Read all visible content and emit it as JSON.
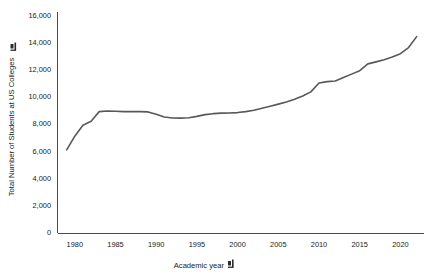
{
  "chart_data": {
    "type": "line",
    "title": "",
    "xlabel": "Academic year",
    "ylabel": "Total Number of Students at US Colleges",
    "xlim": [
      1978,
      2023
    ],
    "ylim": [
      0,
      16800
    ],
    "grid": false,
    "legend": null,
    "x_ticks": [
      "1980",
      "1985",
      "1990",
      "1995",
      "2000",
      "2005",
      "2010",
      "2015",
      "2020"
    ],
    "x_tick_values": [
      1980,
      1985,
      1990,
      1995,
      2000,
      2005,
      2010,
      2015,
      2020
    ],
    "y_ticks": [
      "0",
      "2,000",
      "4,000",
      "6,000",
      "8,000",
      "10,000",
      "12,000",
      "14,000",
      "16,000"
    ],
    "y_tick_values": [
      0,
      2000,
      4000,
      6000,
      8000,
      10000,
      12000,
      14000,
      16000
    ],
    "line_color": "#58585a",
    "series": [
      {
        "name": "Total Number of Students at US Colleges",
        "x": [
          1979,
          1980,
          1981,
          1982,
          1983,
          1984,
          1985,
          1986,
          1987,
          1988,
          1989,
          1990,
          1991,
          1992,
          1993,
          1994,
          1995,
          1996,
          1997,
          1998,
          1999,
          2000,
          2001,
          2002,
          2003,
          2004,
          2005,
          2006,
          2007,
          2008,
          2009,
          2010,
          2011,
          2012,
          2013,
          2014,
          2015,
          2016,
          2017,
          2018,
          2019,
          2020,
          2021,
          2022
        ],
        "values": [
          6100,
          7100,
          7900,
          8200,
          8900,
          8950,
          8930,
          8900,
          8900,
          8900,
          8880,
          8700,
          8500,
          8430,
          8420,
          8450,
          8550,
          8680,
          8750,
          8790,
          8800,
          8830,
          8900,
          9000,
          9150,
          9300,
          9450,
          9600,
          9800,
          10050,
          10350,
          11000,
          11100,
          11150,
          11400,
          11650,
          11900,
          12400,
          12550,
          12700,
          12900,
          13150,
          13600,
          14400
        ]
      }
    ]
  },
  "axis_icons": {
    "x_sort_icon": "sort-icon",
    "y_sort_icon": "sort-icon"
  }
}
